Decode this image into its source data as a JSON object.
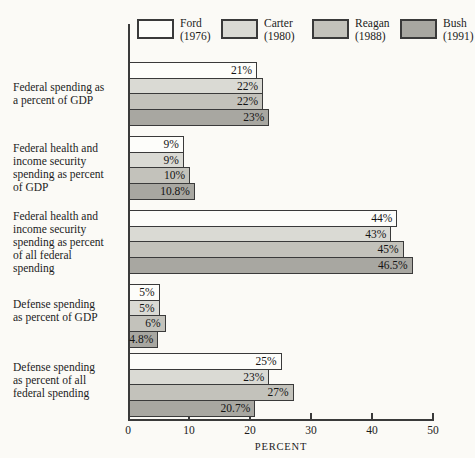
{
  "chart_data": {
    "type": "bar",
    "orientation": "horizontal",
    "title": "",
    "xlabel": "PERCENT",
    "xlim": [
      0,
      50
    ],
    "x_ticks": [
      "0",
      "10",
      "20",
      "30",
      "40",
      "50"
    ],
    "grid": false,
    "legend_position": "top",
    "legend": [
      {
        "name": "Ford\n(1976)",
        "color": "#fdfdfa"
      },
      {
        "name": "Carter\n(1980)",
        "color": "#dadad4"
      },
      {
        "name": "Reagan\n(1988)",
        "color": "#c3c2bb"
      },
      {
        "name": "Bush\n(1991)",
        "color": "#a8a7a1"
      }
    ],
    "bar_border_color": "#3a3a3a",
    "groups": [
      {
        "label": "Federal spending as\na percent of GDP",
        "bars": [
          {
            "president": "Ford",
            "value": 21,
            "display": "21%"
          },
          {
            "president": "Carter",
            "value": 22,
            "display": "22%"
          },
          {
            "president": "Reagan",
            "value": 22,
            "display": "22%"
          },
          {
            "president": "Bush",
            "value": 23,
            "display": "23%"
          }
        ]
      },
      {
        "label": "Federal health and\nincome security\nspending as percent\nof GDP",
        "bars": [
          {
            "president": "Ford",
            "value": 9,
            "display": "9%"
          },
          {
            "president": "Carter",
            "value": 9,
            "display": "9%"
          },
          {
            "president": "Reagan",
            "value": 10,
            "display": "10%"
          },
          {
            "president": "Bush",
            "value": 10.8,
            "display": "10.8%"
          }
        ]
      },
      {
        "label": "Federal health and\nincome security\nspending as percent\nof all federal\nspending",
        "bars": [
          {
            "president": "Ford",
            "value": 44,
            "display": "44%"
          },
          {
            "president": "Carter",
            "value": 43,
            "display": "43%"
          },
          {
            "president": "Reagan",
            "value": 45,
            "display": "45%"
          },
          {
            "president": "Bush",
            "value": 46.5,
            "display": "46.5%"
          }
        ]
      },
      {
        "label": "Defense spending\nas percent of GDP",
        "bars": [
          {
            "president": "Ford",
            "value": 5,
            "display": "5%"
          },
          {
            "president": "Carter",
            "value": 5,
            "display": "5%"
          },
          {
            "president": "Reagan",
            "value": 6,
            "display": "6%"
          },
          {
            "president": "Bush",
            "value": 4.8,
            "display": "4.8%"
          }
        ]
      },
      {
        "label": "Defense spending\nas percent of all\nfederal spending",
        "bars": [
          {
            "president": "Ford",
            "value": 25,
            "display": "25%"
          },
          {
            "president": "Carter",
            "value": 23,
            "display": "23%"
          },
          {
            "president": "Reagan",
            "value": 27,
            "display": "27%"
          },
          {
            "president": "Bush",
            "value": 20.7,
            "display": "20.7%"
          }
        ]
      }
    ]
  }
}
